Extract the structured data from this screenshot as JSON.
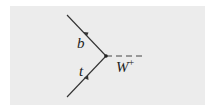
{
  "diagram": {
    "type": "feynman",
    "particles": [
      {
        "name": "t",
        "label": "t",
        "line": "fermion",
        "direction": "incoming"
      },
      {
        "name": "b",
        "label": "b",
        "line": "fermion",
        "direction": "outgoing"
      },
      {
        "name": "W+",
        "label": "W",
        "superscript": "+",
        "line": "boson-dashed",
        "direction": "outgoing"
      }
    ],
    "colors": {
      "background": "#ececec",
      "line": "#333333"
    }
  }
}
